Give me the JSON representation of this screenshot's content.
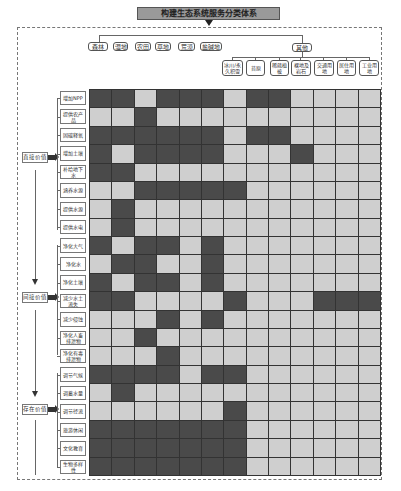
{
  "title": "构建生态系统服务分类体系",
  "colors": {
    "dark_cell": "#4a4a4a",
    "light_cell": "#cfcfcf",
    "title_bg": "#9a9a9a"
  },
  "land_types": {
    "main": [
      "森林",
      "湿地",
      "农田",
      "草地",
      "荒漠",
      "盐碱地"
    ],
    "other_label": "其他",
    "other": [
      "冰川/永久积雪",
      "苔原",
      "稀疏植被",
      "裸地及岩石",
      "交通用地",
      "居住用地",
      "工业用地"
    ]
  },
  "value_groups": [
    {
      "label": "直接价值",
      "services": [
        "增加NPP",
        "提供农产品",
        "固碳释氧",
        "增加土壤",
        "补给地下水",
        "涵养水源",
        "提供水源",
        "提供水电"
      ]
    },
    {
      "label": "间接价值",
      "services": [
        "净化大气",
        "净化水",
        "净化土壤",
        "减少水土流失",
        "减少侵蚀",
        "净化人畜排泄物",
        "净化有毒排泄物"
      ]
    },
    {
      "label": "存在价值",
      "services": [
        "调节气候",
        "调蓄水量",
        "调节径流",
        "旅游休闲",
        "文化教育",
        "生物多样性"
      ]
    }
  ],
  "matrix": {
    "columns": [
      "森林",
      "湿地",
      "农田",
      "草地",
      "荒漠",
      "盐碱地",
      "冰川/永久积雪",
      "苔原",
      "稀疏植被",
      "裸地及岩石",
      "交通用地",
      "居住用地",
      "工业用地"
    ],
    "rows": [
      {
        "service": "增加NPP",
        "cells": [
          1,
          1,
          0,
          1,
          1,
          1,
          0,
          1,
          1,
          0,
          0,
          0,
          0
        ]
      },
      {
        "service": "提供农产品",
        "cells": [
          0,
          0,
          1,
          0,
          0,
          0,
          0,
          0,
          0,
          0,
          0,
          0,
          0
        ]
      },
      {
        "service": "固碳释氧",
        "cells": [
          1,
          1,
          1,
          1,
          1,
          1,
          0,
          1,
          1,
          0,
          0,
          0,
          0
        ]
      },
      {
        "service": "增加土壤",
        "cells": [
          1,
          0,
          1,
          1,
          1,
          1,
          0,
          0,
          0,
          1,
          0,
          0,
          0
        ]
      },
      {
        "service": "补给地下水",
        "cells": [
          1,
          1,
          0,
          0,
          0,
          0,
          0,
          0,
          0,
          0,
          0,
          0,
          0
        ]
      },
      {
        "service": "涵养水源",
        "cells": [
          0,
          0,
          1,
          1,
          1,
          1,
          1,
          0,
          0,
          0,
          0,
          0,
          0
        ]
      },
      {
        "service": "提供水源",
        "cells": [
          0,
          1,
          0,
          0,
          0,
          0,
          0,
          0,
          0,
          0,
          0,
          0,
          0
        ]
      },
      {
        "service": "提供水电",
        "cells": [
          0,
          1,
          0,
          0,
          0,
          0,
          0,
          0,
          0,
          0,
          0,
          0,
          0
        ]
      },
      {
        "service": "净化大气",
        "cells": [
          1,
          0,
          1,
          1,
          0,
          1,
          0,
          0,
          0,
          0,
          0,
          0,
          0
        ]
      },
      {
        "service": "净化水",
        "cells": [
          0,
          1,
          1,
          0,
          0,
          1,
          0,
          0,
          0,
          0,
          0,
          0,
          0
        ]
      },
      {
        "service": "净化土壤",
        "cells": [
          1,
          0,
          1,
          1,
          0,
          1,
          0,
          0,
          0,
          0,
          0,
          0,
          0
        ]
      },
      {
        "service": "减少水土流失",
        "cells": [
          1,
          1,
          0,
          0,
          0,
          0,
          1,
          0,
          0,
          0,
          1,
          1,
          1
        ]
      },
      {
        "service": "减少侵蚀",
        "cells": [
          0,
          0,
          0,
          1,
          0,
          1,
          0,
          0,
          0,
          0,
          0,
          0,
          0
        ]
      },
      {
        "service": "净化人畜排泄物",
        "cells": [
          0,
          0,
          1,
          0,
          0,
          0,
          0,
          0,
          0,
          0,
          0,
          0,
          0
        ]
      },
      {
        "service": "净化有毒排泄物",
        "cells": [
          0,
          0,
          0,
          1,
          0,
          0,
          0,
          0,
          0,
          0,
          0,
          0,
          0
        ]
      },
      {
        "service": "调节气候",
        "cells": [
          1,
          1,
          1,
          1,
          0,
          1,
          1,
          0,
          0,
          0,
          0,
          0,
          0
        ]
      },
      {
        "service": "调蓄水量",
        "cells": [
          0,
          1,
          0,
          0,
          0,
          0,
          0,
          0,
          0,
          0,
          0,
          0,
          0
        ]
      },
      {
        "service": "调节径流",
        "cells": [
          0,
          0,
          0,
          0,
          0,
          0,
          1,
          0,
          0,
          0,
          0,
          0,
          0
        ]
      },
      {
        "service": "旅游休闲",
        "cells": [
          1,
          1,
          1,
          1,
          1,
          1,
          1,
          0,
          0,
          0,
          0,
          0,
          0
        ]
      },
      {
        "service": "文化教育",
        "cells": [
          1,
          1,
          1,
          1,
          1,
          1,
          1,
          0,
          0,
          0,
          0,
          0,
          0
        ]
      },
      {
        "service": "生物多样性",
        "cells": [
          1,
          1,
          1,
          1,
          1,
          1,
          1,
          0,
          0,
          0,
          0,
          0,
          0
        ]
      }
    ]
  }
}
